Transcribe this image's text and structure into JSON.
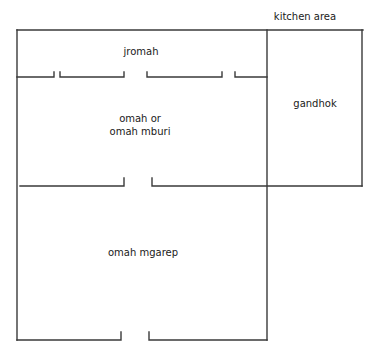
{
  "diagram": {
    "type": "floor-plan",
    "line_color": "#3a3a3a",
    "background": "#ffffff",
    "labels": {
      "kitchen_area": "kitchen area",
      "jromah": "jromah",
      "omah_line1": "omah or",
      "omah_line2": "omah mburi",
      "gandhok": "gandhok",
      "omah_mgarep": "omah mgarep"
    },
    "rooms": [
      {
        "name": "jromah",
        "position": "top strip of main house"
      },
      {
        "name": "omah or omah mburi",
        "position": "middle room"
      },
      {
        "name": "omah mgarep",
        "position": "front room"
      },
      {
        "name": "gandhok",
        "position": "side room (kitchen area)"
      }
    ]
  }
}
